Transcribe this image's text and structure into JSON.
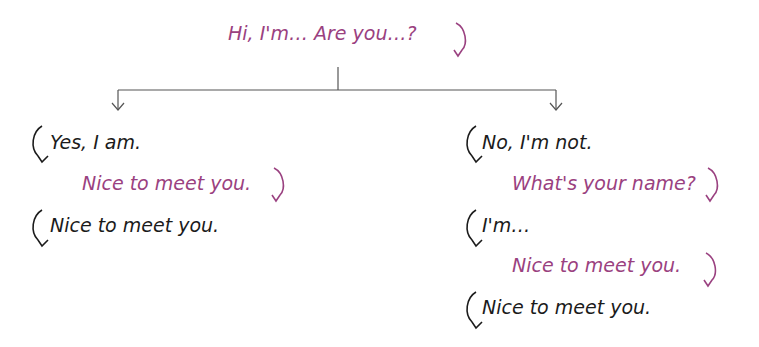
{
  "colors": {
    "speaker_a": "#9a4180",
    "speaker_b": "#1b1b1b",
    "connector": "#555555"
  },
  "root": {
    "text": "Hi, I'm… Are you…?",
    "speaker": "A"
  },
  "branches": [
    {
      "name": "yes",
      "lines": [
        {
          "text": "Yes, I am.",
          "speaker": "B"
        },
        {
          "text": "Nice to meet you.",
          "speaker": "A"
        },
        {
          "text": "Nice to meet you.",
          "speaker": "B"
        }
      ]
    },
    {
      "name": "no",
      "lines": [
        {
          "text": "No, I'm not.",
          "speaker": "B"
        },
        {
          "text": "What's your name?",
          "speaker": "A"
        },
        {
          "text": "I'm…",
          "speaker": "B"
        },
        {
          "text": "Nice to meet you.",
          "speaker": "A"
        },
        {
          "text": "Nice to meet you.",
          "speaker": "B"
        }
      ]
    }
  ]
}
